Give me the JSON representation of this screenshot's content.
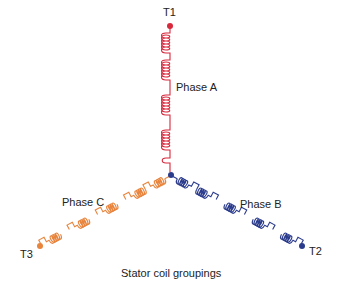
{
  "diagram": {
    "title": "Stator coil groupings",
    "colors": {
      "phase_a": "#d8283c",
      "phase_b": "#2c3c8c",
      "phase_c": "#e8843c",
      "junction": "#2c3c8c"
    },
    "terminals": [
      {
        "id": "T1",
        "label": "T1",
        "phase": "Phase A"
      },
      {
        "id": "T2",
        "label": "T2",
        "phase": "Phase B"
      },
      {
        "id": "T3",
        "label": "T3",
        "phase": "Phase C"
      }
    ],
    "phases": [
      {
        "name": "Phase A",
        "label": "Phase A",
        "coil_groups": 4
      },
      {
        "name": "Phase B",
        "label": "Phase B",
        "coil_groups": 4
      },
      {
        "name": "Phase C",
        "label": "Phase C",
        "coil_groups": 4
      }
    ],
    "connection": "wye (star)"
  }
}
